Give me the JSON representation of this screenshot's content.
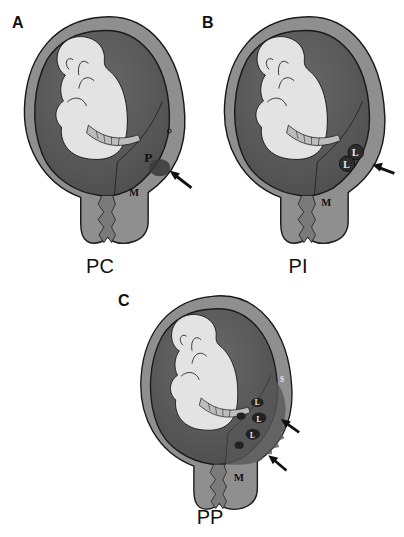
{
  "figure": {
    "panels": [
      {
        "letter": "A",
        "caption": "PC",
        "labels": [
          "P",
          "M"
        ]
      },
      {
        "letter": "B",
        "caption": "PI",
        "labels": [
          "L",
          "L",
          "M"
        ]
      },
      {
        "letter": "C",
        "caption": "PP",
        "labels": [
          "L",
          "L",
          "L",
          "S",
          "M"
        ]
      }
    ],
    "colors": {
      "uterine_wall": "#8c8c8c",
      "cavity": "#5e5e5e",
      "fetus": "#e2e2e2",
      "cord": "#bdbdbd",
      "lesion": "#3a3a3a",
      "outline": "#1a1a1a"
    }
  }
}
